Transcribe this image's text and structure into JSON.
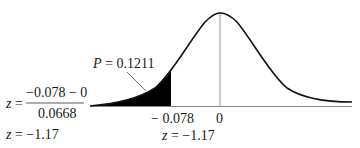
{
  "figure": {
    "type": "normal-distribution-left-tail",
    "probability_label": {
      "var": "P",
      "eq": " = ",
      "value": "0.1211"
    },
    "formula": {
      "lhs_var": "z",
      "eq": " = ",
      "numerator": "−0.078 − 0",
      "denominator": "0.0668",
      "result": {
        "var": "z",
        "eq": " = ",
        "value": "−1.17"
      }
    },
    "axis": {
      "cutoff_label": "− 0.078",
      "center_label": "0",
      "cutoff_z": {
        "var": "z",
        "eq": " = ",
        "value": "−1.17"
      }
    },
    "colors": {
      "curve": "#111111",
      "shade": "#000000",
      "axis": "#888888",
      "centerline": "#999999"
    }
  }
}
